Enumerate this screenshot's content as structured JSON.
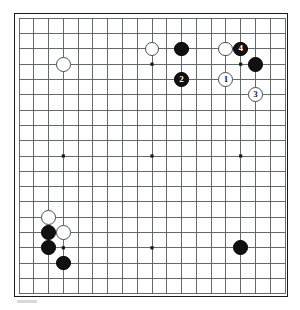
{
  "diagram": {
    "type": "go-board",
    "board_size": 19,
    "caption": "",
    "colors": {
      "board_background": "#ffffff",
      "grid_line": "#555b5e",
      "border": "#1a1a1a",
      "black_stone": "#111111",
      "white_stone": "#ffffff",
      "black_label_text": "#ffffff",
      "white_label_text": "#16191b"
    },
    "star_points": [
      {
        "col": 4,
        "row": 4
      },
      {
        "col": 10,
        "row": 4
      },
      {
        "col": 16,
        "row": 4
      },
      {
        "col": 4,
        "row": 10
      },
      {
        "col": 10,
        "row": 10
      },
      {
        "col": 16,
        "row": 10
      },
      {
        "col": 4,
        "row": 16
      },
      {
        "col": 10,
        "row": 16
      },
      {
        "col": 16,
        "row": 16
      }
    ],
    "stones": [
      {
        "id": "w-d16",
        "color": "white",
        "col": 4,
        "row": 4,
        "label": ""
      },
      {
        "id": "w-k17",
        "color": "white",
        "col": 10,
        "row": 3,
        "label": ""
      },
      {
        "id": "b-m17",
        "color": "black",
        "col": 12,
        "row": 3,
        "label": ""
      },
      {
        "id": "w-p17",
        "color": "white",
        "col": 15,
        "row": 3,
        "label": ""
      },
      {
        "id": "b-move4",
        "color": "black",
        "col": 16,
        "row": 3,
        "label": "4"
      },
      {
        "id": "b-r16",
        "color": "black",
        "col": 17,
        "row": 4,
        "label": ""
      },
      {
        "id": "b-move2",
        "color": "black",
        "col": 12,
        "row": 5,
        "label": "2"
      },
      {
        "id": "w-move1",
        "color": "white",
        "col": 15,
        "row": 5,
        "label": "1"
      },
      {
        "id": "w-move3",
        "color": "white",
        "col": 17,
        "row": 6,
        "label": "3"
      },
      {
        "id": "w-c6",
        "color": "white",
        "col": 3,
        "row": 14,
        "label": ""
      },
      {
        "id": "b-c5",
        "color": "black",
        "col": 3,
        "row": 15,
        "label": ""
      },
      {
        "id": "w-d5",
        "color": "white",
        "col": 4,
        "row": 15,
        "label": ""
      },
      {
        "id": "b-c4",
        "color": "black",
        "col": 3,
        "row": 16,
        "label": ""
      },
      {
        "id": "b-d3",
        "color": "black",
        "col": 4,
        "row": 17,
        "label": ""
      },
      {
        "id": "b-r4",
        "color": "black",
        "col": 16,
        "row": 16,
        "label": ""
      }
    ],
    "move_numbers": [
      "1",
      "2",
      "3",
      "4"
    ]
  }
}
